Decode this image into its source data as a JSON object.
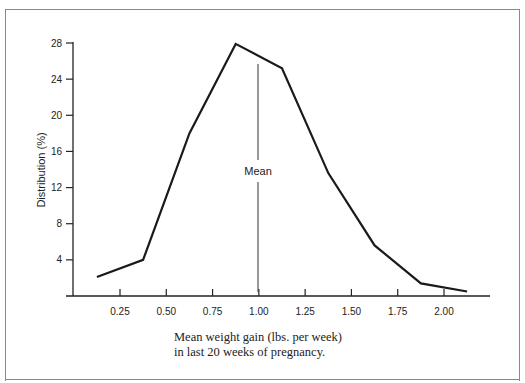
{
  "chart_data": {
    "type": "line",
    "title": "",
    "xlabel": "Mean weight gain (lbs. per week) in last 20 weeks of pregnancy.",
    "ylabel": "Distribution (%)",
    "x_tick_labels": [
      "0.25",
      "0.50",
      "0.75",
      "1.00",
      "1.25",
      "1.50",
      "1.75",
      "2.00"
    ],
    "y_tick_labels": [
      "4",
      "8",
      "12",
      "16",
      "20",
      "24",
      "28"
    ],
    "ylim": [
      0,
      28
    ],
    "xlim": [
      0,
      2.25
    ],
    "grid": false,
    "legend": null,
    "series": [
      {
        "name": "Distribution",
        "x": [
          0.125,
          0.375,
          0.625,
          0.875,
          1.125,
          1.375,
          1.625,
          1.875,
          2.125
        ],
        "values": [
          2.1,
          4.0,
          18.0,
          27.9,
          25.2,
          13.6,
          5.6,
          1.4,
          0.5
        ]
      }
    ],
    "annotations": [
      {
        "text": "Mean",
        "x": 1.0,
        "type": "vertical-line"
      }
    ]
  },
  "caption": {
    "line1": "Mean weight gain (lbs. per week)",
    "line2": "in last 20 weeks of pregnancy."
  },
  "labels": {
    "ylabel": "Distribution (%)",
    "mean": "Mean",
    "x_ticks": [
      "0.25",
      "0.50",
      "0.75",
      "1.00",
      "1.25",
      "1.50",
      "1.75",
      "2.00"
    ],
    "y_ticks": [
      "4",
      "8",
      "12",
      "16",
      "20",
      "24",
      "28"
    ]
  }
}
